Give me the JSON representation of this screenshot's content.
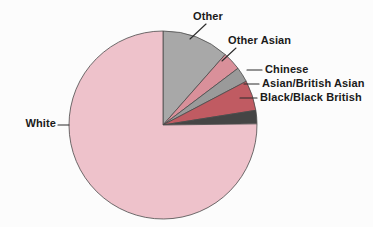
{
  "figure": {
    "background_color": "#fcfcfc",
    "outline_color": "#4a4a4a",
    "leader_color": "#2b2b2b",
    "width": 373,
    "height": 227
  },
  "chart_data": {
    "type": "pie",
    "title": "",
    "xlabel": "",
    "ylabel": "",
    "grid": false,
    "legend_position": "callout-labels",
    "start_angle_deg": 90,
    "direction": "clockwise",
    "center": {
      "x": 163,
      "y": 125
    },
    "radius": 94,
    "categories": [
      "Other",
      "Other Asian",
      "Chinese",
      "Asian/British Asian",
      "Black/Black British",
      "White"
    ],
    "values": [
      11.5,
      3.2,
      2.6,
      5.2,
      2.3,
      75.2
    ],
    "unit": "percent",
    "colors": [
      "#a8a8a8",
      "#d9909a",
      "#9a9a9a",
      "#c05b62",
      "#454545",
      "#eec2cb"
    ],
    "slices": [
      {
        "label": "Other",
        "value": 11.5,
        "color": "#a8a8a8",
        "start_deg": 0.0,
        "end_deg": 41.4
      },
      {
        "label": "Other Asian",
        "value": 3.2,
        "color": "#d9909a",
        "start_deg": 41.4,
        "end_deg": 52.9
      },
      {
        "label": "Chinese",
        "value": 2.6,
        "color": "#9a9a9a",
        "start_deg": 52.9,
        "end_deg": 62.3
      },
      {
        "label": "Asian/British Asian",
        "value": 5.2,
        "color": "#c05b62",
        "start_deg": 62.3,
        "end_deg": 81.0
      },
      {
        "label": "Black/Black British",
        "value": 2.3,
        "color": "#454545",
        "start_deg": 81.0,
        "end_deg": 89.3
      },
      {
        "label": "White",
        "value": 75.2,
        "color": "#eec2cb",
        "start_deg": 89.3,
        "end_deg": 360.0
      }
    ]
  },
  "labels": {
    "other": "Other",
    "other_asian": "Other Asian",
    "chinese": "Chinese",
    "asian_british_asian": "Asian/British Asian",
    "black_black_british": "Black/Black British",
    "white": "White"
  }
}
